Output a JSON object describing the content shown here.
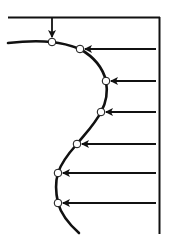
{
  "diagram": {
    "colors": {
      "stroke": "#111111",
      "background": "#ffffff",
      "node_fill": "#ffffff"
    },
    "frame": {
      "top_y": 17,
      "left_x": 8,
      "right_x": 160,
      "bottom_y": 234
    },
    "curve_start": [
      8,
      42
    ],
    "curve_end": [
      79,
      233
    ],
    "nodes": [
      {
        "id": 1,
        "x": 52,
        "y": 42,
        "arrow": "down"
      },
      {
        "id": 2,
        "x": 80,
        "y": 49,
        "arrow": "left"
      },
      {
        "id": 3,
        "x": 106,
        "y": 81,
        "arrow": "left"
      },
      {
        "id": 4,
        "x": 101,
        "y": 112,
        "arrow": "left"
      },
      {
        "id": 5,
        "x": 77,
        "y": 144,
        "arrow": "left"
      },
      {
        "id": 6,
        "x": 58,
        "y": 173,
        "arrow": "left"
      },
      {
        "id": 7,
        "x": 58,
        "y": 203,
        "arrow": "left"
      }
    ]
  }
}
